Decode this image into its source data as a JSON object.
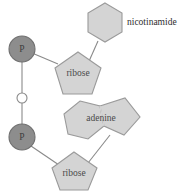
{
  "diagram": {
    "type": "molecular-structure",
    "background_color": "#ffffff",
    "palette": {
      "ring_fill": "#d4d4d4",
      "ring_stroke": "#9a9a9a",
      "phosphate_fill": "#8d8d8d",
      "phosphate_stroke": "#6f6f6f",
      "oxygen_fill": "#ffffff",
      "bond_stroke": "#8a8a8a",
      "label_color": "#2e2e2e"
    },
    "nodes": {
      "nicotinamide": {
        "label": "nicotinamide",
        "shape": "hexagon",
        "label_placement": "external-right"
      },
      "ribose_top": {
        "label": "ribose",
        "shape": "pentagon",
        "label_placement": "internal"
      },
      "phosphate_top": {
        "label": "P",
        "shape": "circle",
        "label_placement": "internal"
      },
      "oxygen_bridge": {
        "label": "",
        "shape": "circle-open",
        "label_placement": "none"
      },
      "phosphate_bottom": {
        "label": "P",
        "shape": "circle",
        "label_placement": "internal"
      },
      "adenine": {
        "label": "adenine",
        "shape": "fused-hexagon-pentagon",
        "label_placement": "internal"
      },
      "ribose_bottom": {
        "label": "ribose",
        "shape": "pentagon",
        "label_placement": "internal"
      }
    },
    "bonds": [
      {
        "from": "nicotinamide",
        "to": "ribose_top"
      },
      {
        "from": "ribose_top",
        "to": "phosphate_top"
      },
      {
        "from": "phosphate_top",
        "to": "oxygen_bridge"
      },
      {
        "from": "oxygen_bridge",
        "to": "phosphate_bottom"
      },
      {
        "from": "phosphate_bottom",
        "to": "ribose_bottom"
      },
      {
        "from": "ribose_bottom",
        "to": "adenine"
      }
    ]
  }
}
